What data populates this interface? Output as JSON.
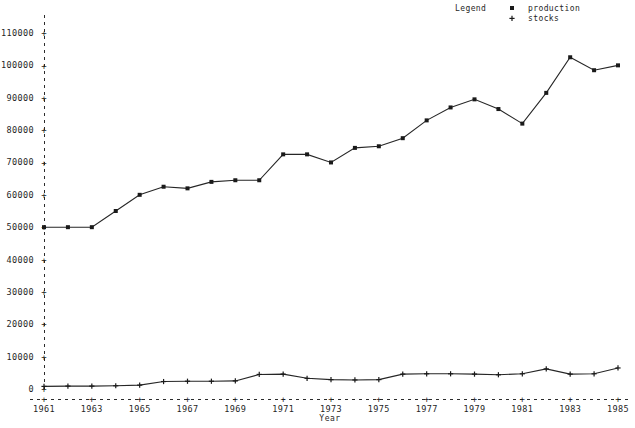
{
  "chart_data": {
    "type": "line",
    "title": "",
    "xlabel": "Year",
    "ylabel": "",
    "grid": false,
    "legend_position": "top-right",
    "legend_title": "Legend",
    "x": [
      1961,
      1962,
      1963,
      1964,
      1965,
      1966,
      1967,
      1968,
      1969,
      1970,
      1971,
      1972,
      1973,
      1974,
      1975,
      1976,
      1977,
      1978,
      1979,
      1980,
      1981,
      1982,
      1983,
      1984,
      1985
    ],
    "xlim": [
      1961,
      1985
    ],
    "ylim": [
      0,
      110000
    ],
    "xticks": [
      1961,
      1963,
      1965,
      1967,
      1969,
      1971,
      1973,
      1975,
      1977,
      1979,
      1981,
      1983,
      1985
    ],
    "xtick_labels": [
      "1961",
      "1963",
      "1965",
      "1967",
      "1969",
      "1971",
      "1973",
      "1975",
      "1977",
      "1979",
      "1981",
      "1983",
      "1985"
    ],
    "yticks": [
      0,
      10000,
      20000,
      30000,
      40000,
      50000,
      60000,
      70000,
      80000,
      90000,
      100000,
      110000
    ],
    "ytick_labels": [
      "0",
      "10000",
      "20000",
      "30000",
      "40000",
      "50000",
      "60000",
      "70000",
      "80000",
      "90000",
      "100000",
      "110000"
    ],
    "series": [
      {
        "name": "production",
        "marker": "square",
        "marker_glyph": "▪",
        "color": "#1a1a1a",
        "values": [
          50000,
          50000,
          50000,
          55000,
          60000,
          62500,
          62000,
          64000,
          64500,
          64500,
          72500,
          72500,
          70000,
          74500,
          75000,
          77500,
          83000,
          87000,
          89500,
          86500,
          82000,
          91500,
          102500,
          98500,
          100000
        ]
      },
      {
        "name": "stocks",
        "marker": "plus",
        "marker_glyph": "+",
        "color": "#1a1a1a",
        "values": [
          800,
          900,
          900,
          1000,
          1200,
          2300,
          2400,
          2400,
          2500,
          4500,
          4600,
          3300,
          2900,
          2800,
          2900,
          4600,
          4700,
          4700,
          4600,
          4400,
          4700,
          6200,
          4600,
          4700,
          6500
        ]
      }
    ]
  },
  "legend": {
    "title": "Legend",
    "entries": [
      {
        "symbol": "▪",
        "label": "production"
      },
      {
        "symbol": "+",
        "label": "stocks"
      }
    ]
  },
  "axes": {
    "x_title": "Year",
    "y_title": ""
  }
}
